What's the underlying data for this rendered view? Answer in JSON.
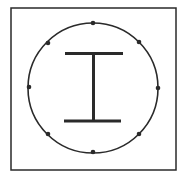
{
  "diagram": {
    "type": "cross-section",
    "canvas": {
      "width": 182,
      "height": 179,
      "background": "#ffffff"
    },
    "colors": {
      "stroke": "#2a2a2a",
      "fill": "#2a2a2a"
    },
    "square": {
      "x": 11,
      "y": 8,
      "width": 165,
      "height": 162,
      "stroke_width": 1.5
    },
    "circle": {
      "cx": 93,
      "cy": 88,
      "r": 65,
      "stroke_width": 1.6
    },
    "bars": {
      "count": 8,
      "radius": 2.3,
      "positions": [
        {
          "cx": 93,
          "cy": 23
        },
        {
          "cx": 139,
          "cy": 42
        },
        {
          "cx": 158,
          "cy": 88
        },
        {
          "cx": 139,
          "cy": 134
        },
        {
          "cx": 93,
          "cy": 152
        },
        {
          "cx": 48,
          "cy": 134
        },
        {
          "cx": 29,
          "cy": 87
        },
        {
          "cx": 48,
          "cy": 43
        }
      ]
    },
    "i_beam": {
      "top_flange": {
        "x": 65,
        "y": 52,
        "width": 58,
        "height": 3
      },
      "bottom_flange": {
        "x": 64,
        "y": 119.5,
        "width": 57,
        "height": 3
      },
      "web": {
        "x": 92,
        "y": 54,
        "width": 3,
        "height": 67
      }
    }
  }
}
